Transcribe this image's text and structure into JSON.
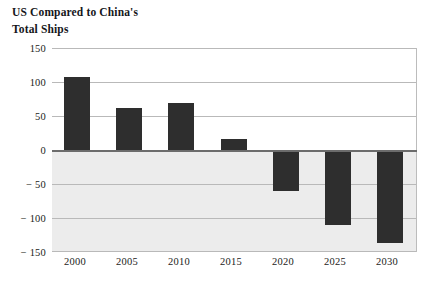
{
  "chart_data": {
    "type": "bar",
    "title": "US Compared to China's\nTotal Ships",
    "xlabel": "",
    "ylabel": "",
    "categories": [
      "2000",
      "2005",
      "2010",
      "2015",
      "2020",
      "2025",
      "2030"
    ],
    "values": [
      107,
      62,
      69,
      16,
      -60,
      -110,
      -137
    ],
    "series": [
      {
        "name": "US Compared to China's Total Ships",
        "values": [
          107,
          62,
          69,
          16,
          -60,
          -110,
          -137
        ]
      }
    ],
    "ylim": [
      -150,
      150
    ],
    "yticks": [
      150,
      100,
      50,
      0,
      -50,
      -100,
      -150
    ],
    "ytick_labels": [
      "150",
      "100",
      "50",
      "0",
      "− 50",
      "− 100",
      "− 150"
    ],
    "xtick_labels": [
      "2000",
      "2005",
      "2010",
      "2015",
      "2020",
      "2025",
      "2030"
    ],
    "grid": true,
    "legend": false,
    "legend_position": "none",
    "bar_color": "#2e2e2e",
    "gridline_color": "#b9b9b9",
    "zero_line_color": "#6c6c6c",
    "negative_region_color": "#ececec",
    "background_color": "#ffffff"
  }
}
